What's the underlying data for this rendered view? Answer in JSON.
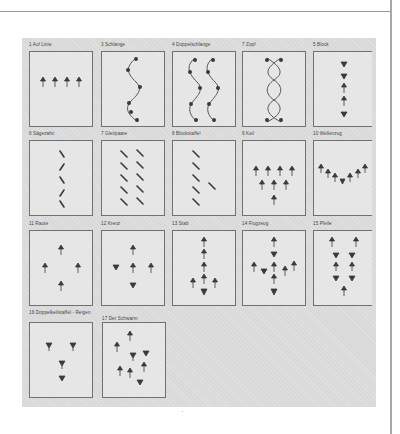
{
  "page": {
    "type": "scanned-book-figure",
    "language": "German"
  },
  "figure": {
    "panels": [
      {
        "number": "1",
        "label": "1 Auf Linie",
        "formation": "row of 4 figures facing up"
      },
      {
        "number": "3",
        "label": "3 Schlange",
        "formation": "single wavy line"
      },
      {
        "number": "4",
        "label": "4 Doppelschlange",
        "formation": "two wavy lines"
      },
      {
        "number": "7",
        "label": "7 Zopf",
        "formation": "braided double helix"
      },
      {
        "number": "5",
        "label": "5 Block",
        "formation": "vertical column"
      },
      {
        "number": "6",
        "label": "6 Sägezahn",
        "formation": "zigzag column"
      },
      {
        "number": "7",
        "label": "7 Gleitpaare",
        "formation": "two diagonal columns"
      },
      {
        "number": "8",
        "label": "8 Blockstaffel",
        "formation": "diagonal column with one offset"
      },
      {
        "number": "9",
        "label": "9 Keil",
        "formation": "wedge 4-3-1"
      },
      {
        "number": "10",
        "label": "10 Wellenzug",
        "formation": "V-shaped line"
      },
      {
        "number": "11",
        "label": "11 Raute",
        "formation": "diamond of 4"
      },
      {
        "number": "12",
        "label": "12 Kreuz",
        "formation": "cross of 5"
      },
      {
        "number": "13",
        "label": "13 Stab",
        "formation": "column with side pair"
      },
      {
        "number": "14",
        "label": "14 Flugzeug",
        "formation": "airplane"
      },
      {
        "number": "15",
        "label": "15 Pfeile",
        "formation": "double column converging"
      },
      {
        "number": "16",
        "label": "16 Doppelkeilstaffel - Reigen",
        "formation": "scattered 4"
      },
      {
        "number": "17",
        "label": "17 Der Schwarm",
        "formation": "swarm of 8"
      }
    ]
  },
  "colors": {
    "plate": "#d9d9d9",
    "box_fill": "#e6e6e6",
    "ink": "#3a3a3a"
  }
}
